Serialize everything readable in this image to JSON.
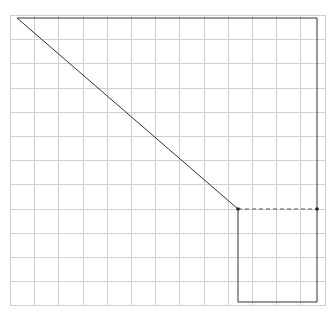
{
  "diagram": {
    "type": "grid-polygon",
    "grid": {
      "x0": 10,
      "y0": 15,
      "x1": 325,
      "y1": 305,
      "step": 24.2,
      "color": "#d0d0d0",
      "border_color": "#cfcfcf"
    },
    "shape": {
      "stroke": "#333333",
      "points": [
        [
          17,
          18
        ],
        [
          317,
          18
        ],
        [
          317,
          302
        ],
        [
          238,
          302
        ],
        [
          238,
          209
        ],
        [
          17,
          18
        ]
      ]
    },
    "dashed_segment": {
      "from": [
        238,
        209
      ],
      "to": [
        317,
        209
      ],
      "stroke": "#555555"
    },
    "markers": [
      [
        238,
        209
      ],
      [
        317,
        209
      ]
    ]
  }
}
